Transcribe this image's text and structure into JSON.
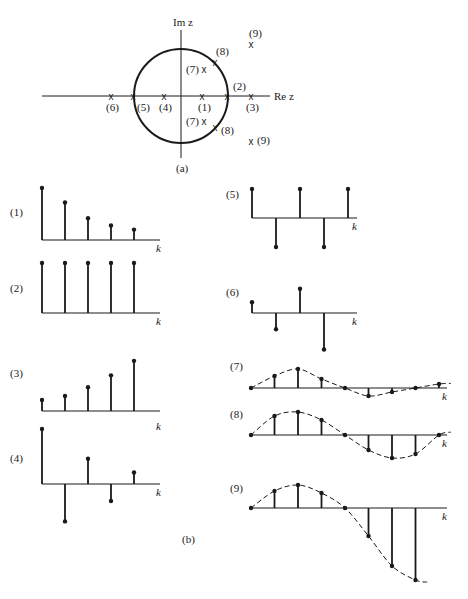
{
  "figure": {
    "part_a_caption": "(a)",
    "part_b_caption": "(b)",
    "colors": {
      "ink": "#1a1a1a",
      "background": "#ffffff"
    }
  },
  "pole_zero": {
    "im_axis_label": "Im z",
    "re_axis_label": "Re z",
    "unit_circle": {
      "cx": 181,
      "cy": 96,
      "r": 47
    },
    "poles": [
      {
        "label": "(1)",
        "x": 203,
        "y": 96,
        "lx": 198,
        "ly": 111
      },
      {
        "label": "(2)",
        "x": 228,
        "y": 96,
        "lx": 233,
        "ly": 90
      },
      {
        "label": "(3)",
        "x": 252,
        "y": 96,
        "lx": 246,
        "ly": 111
      },
      {
        "label": "(4)",
        "x": 165,
        "y": 96,
        "lx": 159,
        "ly": 111
      },
      {
        "label": "(5)",
        "x": 134,
        "y": 96,
        "lx": 137,
        "ly": 111
      },
      {
        "label": "(6)",
        "x": 112,
        "y": 96,
        "lx": 106,
        "ly": 111
      },
      {
        "label": "(7)",
        "x": 205,
        "y": 69,
        "lx": 186,
        "ly": 73
      },
      {
        "label": "(7)",
        "x": 205,
        "y": 121,
        "lx": 186,
        "ly": 125
      },
      {
        "label": "(8)",
        "x": 216,
        "y": 62,
        "lx": 216,
        "ly": 55
      },
      {
        "label": "(8)",
        "x": 216,
        "y": 127,
        "lx": 221,
        "ly": 134
      },
      {
        "label": "(9)",
        "x": 252,
        "y": 44,
        "lx": 249,
        "ly": 37
      },
      {
        "label": "(9)",
        "x": 252,
        "y": 141,
        "lx": 257,
        "ly": 144
      }
    ],
    "pole_marker": "x"
  },
  "chart_data": [
    {
      "type": "stem",
      "id": "1",
      "label": "(1)",
      "xlabel": "k",
      "description": "decaying real pole inside unit circle",
      "values": [
        1.0,
        0.72,
        0.42,
        0.28,
        0.2
      ]
    },
    {
      "type": "stem",
      "id": "2",
      "label": "(2)",
      "xlabel": "k",
      "description": "constant, pole at z=1",
      "values": [
        1.0,
        1.0,
        1.0,
        1.0,
        1.0
      ]
    },
    {
      "type": "stem",
      "id": "3",
      "label": "(3)",
      "xlabel": "k",
      "description": "growing real pole outside unit circle",
      "values": [
        0.25,
        0.34,
        0.54,
        0.81,
        1.14
      ]
    },
    {
      "type": "stem",
      "id": "4",
      "label": "(4)",
      "xlabel": "k",
      "description": "alternating decaying, negative real pole inside",
      "values": [
        1.0,
        -0.68,
        0.46,
        -0.31,
        0.21
      ]
    },
    {
      "type": "stem",
      "id": "5",
      "label": "(5)",
      "xlabel": "k",
      "description": "alternating constant, pole at z=-1",
      "values": [
        1.0,
        -1.0,
        1.0,
        -1.0,
        1.0
      ]
    },
    {
      "type": "stem",
      "id": "6",
      "label": "(6)",
      "xlabel": "k",
      "description": "alternating growing, negative real pole outside",
      "values": [
        0.4,
        -0.6,
        0.9,
        -1.35
      ]
    },
    {
      "type": "stem",
      "id": "7",
      "label": "(7)",
      "xlabel": "k",
      "description": "damped oscillation with dashed envelope",
      "values": [
        0,
        12,
        19,
        9,
        0,
        -8,
        -4,
        0,
        4
      ]
    },
    {
      "type": "stem",
      "id": "8",
      "label": "(8)",
      "xlabel": "k",
      "description": "sustained oscillation with dashed envelope",
      "values": [
        0,
        19,
        23,
        15,
        0,
        -15,
        -23,
        -19,
        0
      ]
    },
    {
      "type": "stem",
      "id": "9",
      "label": "(9)",
      "xlabel": "k",
      "description": "growing oscillation with dashed envelope",
      "values": [
        0,
        17,
        23,
        15,
        0,
        -28,
        -58,
        -72
      ]
    }
  ],
  "plots": {
    "p1": {
      "label": "(1)",
      "k": "k"
    },
    "p2": {
      "label": "(2)",
      "k": "k"
    },
    "p3": {
      "label": "(3)",
      "k": "k"
    },
    "p4": {
      "label": "(4)",
      "k": "k"
    },
    "p5": {
      "label": "(5)",
      "k": "k"
    },
    "p6": {
      "label": "(6)",
      "k": "k"
    },
    "p7": {
      "label": "(7)",
      "k": "k"
    },
    "p8": {
      "label": "(8)",
      "k": "k"
    },
    "p9": {
      "label": "(9)",
      "k": "k"
    }
  }
}
